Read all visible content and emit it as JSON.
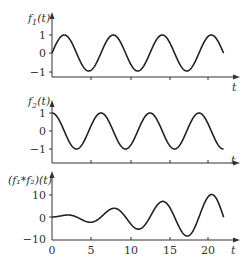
{
  "chart_data": [
    {
      "type": "line",
      "ylabel": "f1(t)",
      "xlabel": "t",
      "function": "sin(t)",
      "yticks": [
        "1",
        "0",
        "−1"
      ],
      "ytick_values": [
        1,
        0,
        -1
      ],
      "xlim": [
        0,
        22
      ],
      "ylim": [
        -1,
        1
      ],
      "grid": false
    },
    {
      "type": "line",
      "ylabel": "f2(t)",
      "xlabel": "t",
      "function": "cos(t)",
      "yticks": [
        "1",
        "0",
        "−1"
      ],
      "ytick_values": [
        1,
        0,
        -1
      ],
      "xlim": [
        0,
        22
      ],
      "ylim": [
        -1,
        1
      ],
      "grid": false
    },
    {
      "type": "line",
      "ylabel": "(f1*f2)(t)",
      "xlabel": "t",
      "function": "(t/2)·sin(t)",
      "yticks": [
        "10",
        "0",
        "−10"
      ],
      "ytick_values": [
        10,
        0,
        -10
      ],
      "xticks": [
        "0",
        "5",
        "10",
        "15",
        "20"
      ],
      "xtick_values": [
        0,
        5,
        10,
        15,
        20
      ],
      "xlim": [
        0,
        22
      ],
      "ylim": [
        -10,
        10
      ],
      "grid": false
    }
  ],
  "labels": {
    "p1_y": "f",
    "p1_sub": "1",
    "p1_arg": "(t)",
    "p2_y": "f",
    "p2_sub": "2",
    "p2_arg": "(t)",
    "p3_y": "(f₁*f₂)(t)",
    "t": "t",
    "p1_ticks": [
      "1",
      "0",
      "−1"
    ],
    "p2_ticks": [
      "1",
      "0",
      "−1"
    ],
    "p3_ticks": [
      "10",
      "0",
      "−10"
    ],
    "x_ticks": [
      "0",
      "5",
      "10",
      "15",
      "20"
    ]
  }
}
